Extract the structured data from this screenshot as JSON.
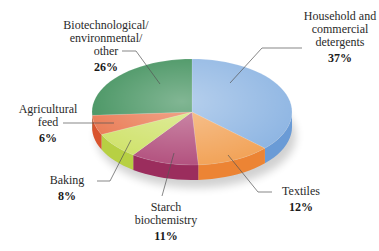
{
  "chart_data": {
    "type": "pie",
    "style": "3d",
    "title": "",
    "categories": [
      "Household and commercial detergents",
      "Textiles",
      "Starch biochemistry",
      "Baking",
      "Agricultural feed",
      "Biotechnological/ environmental/ other"
    ],
    "values": [
      37,
      12,
      11,
      8,
      6,
      26
    ],
    "unit": "%",
    "colors": [
      "#8fb6e3",
      "#f2a45a",
      "#b3527f",
      "#cfe26a",
      "#e9774f",
      "#3e8f5a"
    ],
    "side_colors": [
      "#6a9bd6",
      "#ec8434",
      "#9b2d5d",
      "#b7d043",
      "#d9542e",
      "#2c7a46"
    ],
    "start_angle_deg": 0,
    "direction": "clockwise",
    "legend": "none (leader-line labels)"
  },
  "labels": [
    {
      "lines": [
        "Household and",
        "commercial",
        "detergents"
      ],
      "pct": "37%"
    },
    {
      "lines": [
        "Textiles"
      ],
      "pct": "12%"
    },
    {
      "lines": [
        "Starch",
        "biochemistry"
      ],
      "pct": "11%"
    },
    {
      "lines": [
        "Baking"
      ],
      "pct": "8%"
    },
    {
      "lines": [
        "Agricultural",
        "feed"
      ],
      "pct": "6%"
    },
    {
      "lines": [
        "Biotechnological/",
        "environmental/",
        "other"
      ],
      "pct": "26%"
    }
  ]
}
